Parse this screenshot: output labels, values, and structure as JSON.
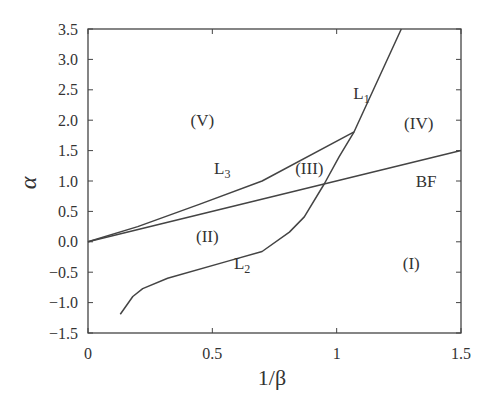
{
  "chart_data": {
    "type": "line",
    "title": "",
    "xlabel": "1/β",
    "ylabel": "α",
    "xlim": [
      0,
      1.5
    ],
    "ylim": [
      -1.5,
      3.5
    ],
    "xticks": [
      0,
      0.5,
      1,
      1.5
    ],
    "xtick_labels": [
      "0",
      "0.5",
      "1",
      "1.5"
    ],
    "yticks": [
      -1.5,
      -1.0,
      -0.5,
      0.0,
      0.5,
      1.0,
      1.5,
      2.0,
      2.5,
      3.0,
      3.5
    ],
    "ytick_labels": [
      "−1.5",
      "−1.0",
      "−0.5",
      "0.0",
      "0.5",
      "1.0",
      "1.5",
      "2.0",
      "2.5",
      "3.0",
      "3.5"
    ],
    "grid": false,
    "legend": "none",
    "series": [
      {
        "name": "BF",
        "x": [
          0,
          1.5
        ],
        "y": [
          0,
          1.5
        ]
      },
      {
        "name": "L3",
        "x": [
          0,
          0.2,
          0.45,
          0.7,
          1.07
        ],
        "y": [
          0,
          0.25,
          0.62,
          1.0,
          1.81
        ]
      },
      {
        "name": "L1/L2",
        "x": [
          0.13,
          0.18,
          0.22,
          0.32,
          0.57,
          0.7,
          0.81,
          0.87,
          0.95,
          1.01,
          1.07,
          1.26
        ],
        "y": [
          -1.19,
          -0.9,
          -0.77,
          -0.6,
          -0.31,
          -0.16,
          0.16,
          0.41,
          0.95,
          1.4,
          1.81,
          3.5
        ]
      }
    ],
    "annotations": [
      {
        "text": "(V)",
        "x": 0.46,
        "y": 2.0
      },
      {
        "text": "L3",
        "sub": "3",
        "base": "L",
        "x": 0.54,
        "y": 1.22
      },
      {
        "text": "(III)",
        "x": 0.89,
        "y": 1.22
      },
      {
        "text": "(IV)",
        "x": 1.33,
        "y": 1.95
      },
      {
        "text": "L1",
        "sub": "1",
        "base": "L",
        "x": 1.1,
        "y": 2.45
      },
      {
        "text": "BF",
        "x": 1.36,
        "y": 1.0
      },
      {
        "text": "(II)",
        "x": 0.48,
        "y": 0.1
      },
      {
        "text": "L2",
        "sub": "2",
        "base": "L",
        "x": 0.62,
        "y": -0.35
      },
      {
        "text": "(I)",
        "x": 1.3,
        "y": -0.35
      }
    ]
  }
}
